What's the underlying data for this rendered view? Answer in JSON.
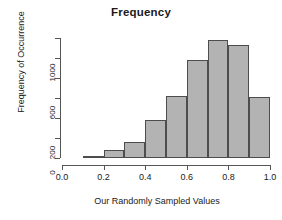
{
  "chart_data": {
    "type": "bar",
    "title": "Frequency",
    "xlabel": "Our Randomly Sampled Values",
    "ylabel": "Frequency of Occurrence",
    "bin_edges": [
      0.1,
      0.2,
      0.3,
      0.4,
      0.5,
      0.6,
      0.7,
      0.8,
      0.9,
      1.0
    ],
    "categories": [
      "0.1-0.2",
      "0.2-0.3",
      "0.3-0.4",
      "0.4-0.5",
      "0.5-0.6",
      "0.6-0.7",
      "0.7-0.8",
      "0.8-0.9",
      "0.9-1.0"
    ],
    "values": [
      10,
      80,
      160,
      380,
      620,
      980,
      1180,
      1130,
      610
    ],
    "bin_starts": [
      0.1,
      0.2,
      0.3,
      0.4,
      0.5,
      0.6,
      0.7,
      0.8,
      0.9
    ],
    "bin_width": 0.1,
    "xlim": [
      0.0,
      1.0
    ],
    "ylim": [
      0,
      1200
    ],
    "x_ticks": [
      {
        "value": 0.0,
        "label": "0.0"
      },
      {
        "value": 0.2,
        "label": "0.2"
      },
      {
        "value": 0.4,
        "label": "0.4"
      },
      {
        "value": 0.6,
        "label": "0.6"
      },
      {
        "value": 0.8,
        "label": "0.8"
      },
      {
        "value": 1.0,
        "label": "1.0"
      }
    ],
    "y_ticks": [
      {
        "value": 0,
        "label": "0"
      },
      {
        "value": 200,
        "label": "200"
      },
      {
        "value": 400,
        "label": ""
      },
      {
        "value": 600,
        "label": "600"
      },
      {
        "value": 800,
        "label": ""
      },
      {
        "value": 1000,
        "label": "1000"
      },
      {
        "value": 1200,
        "label": ""
      }
    ],
    "grid": false,
    "legend": false,
    "bar_fill_color": "#b3b3b3",
    "bar_border_color": "#4d4d4d",
    "axis_color": "#555555",
    "text_color": "#1a1a1a",
    "background_color": "#ffffff"
  }
}
